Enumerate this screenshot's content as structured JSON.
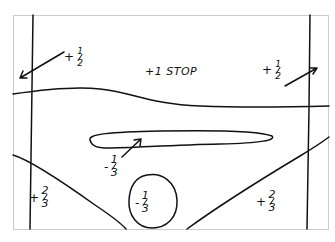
{
  "diagram": {
    "frame_color": "#cccccc",
    "ink_color": "#111111",
    "background": "#ffffff",
    "labels": {
      "top_center": "+1 STOP",
      "top_left": {
        "sign": "+",
        "num": "1",
        "den": "2"
      },
      "top_right": {
        "sign": "+",
        "num": "1",
        "den": "2"
      },
      "center_oval": {
        "sign": "-",
        "num": "1",
        "den": "3"
      },
      "bottom_circle": {
        "sign": "-",
        "num": "1",
        "den": "3"
      },
      "bottom_left": {
        "sign": "+",
        "num": "2",
        "den": "3"
      },
      "bottom_right": {
        "sign": "+",
        "num": "2",
        "den": "3"
      }
    }
  }
}
